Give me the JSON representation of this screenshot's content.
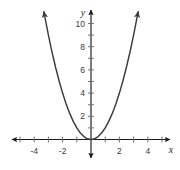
{
  "chart_data": {
    "type": "line",
    "title": "",
    "subtitle": "",
    "xlabel": "x",
    "ylabel": "y",
    "function": "y = x^2",
    "grid": false,
    "legend": null,
    "xlim": [
      -5.2,
      5.2
    ],
    "ylim": [
      -1.2,
      11.2
    ],
    "xticks": [
      -5,
      -4,
      -3,
      -2,
      -1,
      1,
      2,
      3,
      4,
      5
    ],
    "yticks": [
      1,
      2,
      3,
      4,
      5,
      6,
      7,
      8,
      9,
      10
    ],
    "xtick_labels": [
      "-4",
      "-2",
      "2",
      "4"
    ],
    "xtick_labeled_values": [
      -4,
      -2,
      2,
      4
    ],
    "ytick_labels": [
      "2",
      "4",
      "6",
      "8",
      "10"
    ],
    "ytick_labeled_values": [
      2,
      4,
      6,
      8,
      10
    ],
    "series": [
      {
        "name": "y = x^2",
        "color": "#3c3c3c",
        "x": [
          -3.32,
          -3.0,
          -2.75,
          -2.5,
          -2.25,
          -2.0,
          -1.75,
          -1.5,
          -1.25,
          -1.0,
          -0.75,
          -0.5,
          -0.25,
          0,
          0.25,
          0.5,
          0.75,
          1.0,
          1.25,
          1.5,
          1.75,
          2.0,
          2.25,
          2.5,
          2.75,
          3.0,
          3.32
        ],
        "y": [
          11.02,
          9.0,
          7.5625,
          6.25,
          5.0625,
          4.0,
          3.0625,
          2.25,
          1.5625,
          1.0,
          0.5625,
          0.25,
          0.0625,
          0,
          0.0625,
          0.25,
          0.5625,
          1.0,
          1.5625,
          2.25,
          3.0625,
          4.0,
          5.0625,
          6.25,
          7.5625,
          9.0,
          11.02
        ],
        "arrow_start": true,
        "arrow_end": true,
        "vertex": [
          0,
          0
        ]
      }
    ],
    "axis_arrows": {
      "x_positive": true,
      "x_negative": true,
      "y_positive": true,
      "y_negative": true
    },
    "colors": {
      "curve": "#3c3c3c",
      "axis": "#1a1a1a",
      "tick": "#6e6e6e",
      "label": "#3a3a3a",
      "background": "#ffffff"
    }
  },
  "labels": {
    "x_axis_name": "x",
    "y_axis_name": "y",
    "x_neg4": "-4",
    "x_neg2": "-2",
    "x_pos2": "2",
    "x_pos4": "4",
    "y_2": "2",
    "y_4": "4",
    "y_6": "6",
    "y_8": "8",
    "y_10": "10"
  }
}
